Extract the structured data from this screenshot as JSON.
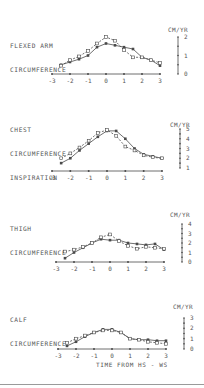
{
  "chart_data": [
    {
      "type": "line",
      "title": "FLEXED ARM CIRCUMFERENCE",
      "title_lines": [
        "FLEXED ARM",
        "CIRCUMFERENCE"
      ],
      "ylabel": "CM/YR",
      "xlabel": "",
      "x_ticks": [
        "-3",
        "-2",
        "-1",
        "0",
        "1",
        "2",
        "3"
      ],
      "y_ticks": [
        "0",
        "1",
        "2"
      ],
      "ylim": [
        0,
        2
      ],
      "xlim": [
        -3,
        3
      ],
      "x": [
        -2.5,
        -2,
        -1.5,
        -1,
        -0.5,
        0,
        0.5,
        1,
        1.5,
        2,
        2.5,
        3
      ],
      "series": [
        {
          "name": "solid",
          "style": "solid",
          "values": [
            0.5,
            0.65,
            0.8,
            1.0,
            1.45,
            1.65,
            1.55,
            1.45,
            1.35,
            0.9,
            0.75,
            0.45
          ]
        },
        {
          "name": "dashed",
          "style": "dashed",
          "values": [
            0.45,
            0.75,
            0.95,
            1.25,
            1.65,
            2.0,
            1.8,
            1.3,
            0.9,
            0.9,
            0.75,
            0.6
          ]
        }
      ],
      "grid": false
    },
    {
      "type": "line",
      "title": "CHEST CIRCUMFERENCE INSPIRATION",
      "title_lines": [
        "CHEST",
        "CIRCUMFERENCE",
        "INSPIRATION"
      ],
      "ylabel": "CM/YR",
      "xlabel": "",
      "x_ticks": [
        "-3",
        "-2",
        "-1",
        "0",
        "1",
        "2",
        "3"
      ],
      "y_ticks": [
        "1",
        "2",
        "3",
        "4",
        "5"
      ],
      "ylim": [
        1,
        5
      ],
      "xlim": [
        -3,
        3
      ],
      "x": [
        -2.5,
        -2,
        -1.5,
        -1,
        -0.5,
        0,
        0.5,
        1,
        1.5,
        2,
        2.5,
        3
      ],
      "series": [
        {
          "name": "solid",
          "style": "solid",
          "values": [
            1.5,
            2.0,
            2.8,
            3.5,
            4.2,
            4.8,
            4.8,
            4.0,
            3.0,
            2.4,
            2.2,
            2.0
          ]
        },
        {
          "name": "dashed",
          "style": "dashed",
          "values": [
            2.0,
            2.5,
            3.1,
            3.8,
            4.6,
            4.9,
            4.3,
            3.2,
            2.8,
            2.3,
            2.1,
            2.0
          ]
        }
      ],
      "grid": false
    },
    {
      "type": "line",
      "title": "THIGH CIRCUMFERENCE",
      "title_lines": [
        "THIGH",
        "CIRCUMFERENCE"
      ],
      "ylabel": "CM/YR",
      "xlabel": "",
      "x_ticks": [
        "-3",
        "-2",
        "-1",
        "0",
        "1",
        "2",
        "3"
      ],
      "y_ticks": [
        "0",
        "1",
        "2",
        "3",
        "4"
      ],
      "ylim": [
        0,
        4
      ],
      "xlim": [
        -3,
        3
      ],
      "x": [
        -2.5,
        -2,
        -1.5,
        -1,
        -0.5,
        0,
        0.5,
        1,
        1.5,
        2,
        2.5,
        3
      ],
      "series": [
        {
          "name": "solid",
          "style": "solid",
          "values": [
            0.4,
            1.0,
            1.5,
            2.0,
            2.4,
            2.3,
            2.3,
            2.0,
            1.9,
            1.8,
            1.9,
            1.3
          ]
        },
        {
          "name": "dashed",
          "style": "dashed",
          "values": [
            1.1,
            1.3,
            1.6,
            2.0,
            2.6,
            2.9,
            2.2,
            1.7,
            1.4,
            1.6,
            1.5,
            1.4
          ]
        }
      ],
      "grid": false
    },
    {
      "type": "line",
      "title": "CALF CIRCUMFERENCE",
      "title_lines": [
        "CALF",
        "CIRCUMFERENCE"
      ],
      "ylabel": "CM/YR",
      "xlabel": "TIME FROM HS - WS",
      "x_ticks": [
        "-3",
        "-2",
        "-1",
        "0",
        "1",
        "2",
        "3"
      ],
      "y_ticks": [
        "0",
        "1",
        "2",
        "3"
      ],
      "ylim": [
        0,
        3
      ],
      "xlim": [
        -3,
        3
      ],
      "x": [
        -2.5,
        -2,
        -1.5,
        -1,
        -0.5,
        0,
        0.5,
        1,
        1.5,
        2,
        2.5,
        3
      ],
      "series": [
        {
          "name": "solid",
          "style": "solid",
          "values": [
            0.3,
            0.7,
            1.2,
            1.6,
            1.9,
            1.9,
            1.6,
            1.0,
            0.9,
            0.9,
            0.8,
            0.8
          ]
        },
        {
          "name": "dashed",
          "style": "dashed",
          "values": [
            0.6,
            1.0,
            1.3,
            1.6,
            1.8,
            1.8,
            1.6,
            1.0,
            0.9,
            0.7,
            0.6,
            0.5
          ]
        }
      ],
      "grid": false
    }
  ],
  "panels": [
    {
      "title1": "FLEXED ARM",
      "title2": "CIRCUMFERENCE",
      "title3": "",
      "unit": "CM/YR"
    },
    {
      "title1": "CHEST",
      "title2": "CIRCUMFERENCE",
      "title3": "INSPIRATION",
      "unit": "CM/YR"
    },
    {
      "title1": "THIGH",
      "title2": "CIRCUMFERENCE",
      "title3": "",
      "unit": "CM/YR"
    },
    {
      "title1": "CALF",
      "title2": "CIRCUMFERENCE",
      "title3": "",
      "unit": "CM/YR"
    }
  ],
  "x_axis_title": "TIME FROM HS - WS",
  "colors": {
    "ink": "#4a4a4a",
    "background": "#ffffff",
    "rule": "#9a9a9a"
  }
}
